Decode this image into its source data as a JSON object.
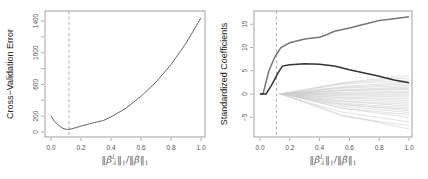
{
  "chart_data": [
    {
      "type": "line",
      "title": "",
      "xlabel": "||β̂ᴸλ||₁/||β̂||₁",
      "ylabel": "Cross−Validation Error",
      "xlim": [
        0.0,
        1.0
      ],
      "ylim": [
        0,
        1400
      ],
      "x_ticks": [
        "0.0",
        "0.2",
        "0.4",
        "0.6",
        "0.8",
        "1.0"
      ],
      "y_ticks": [
        "0",
        "200",
        "600",
        "1000",
        "1400"
      ],
      "y_minor_ticks": [
        400,
        800,
        1200
      ],
      "grid": false,
      "vline": {
        "x": 0.12,
        "style": "dashed"
      },
      "series": [
        {
          "name": "cv_error",
          "x": [
            0.0,
            0.02,
            0.05,
            0.08,
            0.11,
            0.15,
            0.2,
            0.25,
            0.3,
            0.35,
            0.4,
            0.5,
            0.6,
            0.7,
            0.8,
            0.9,
            1.0
          ],
          "y": [
            205,
            140,
            85,
            45,
            30,
            45,
            75,
            100,
            125,
            145,
            190,
            300,
            450,
            630,
            850,
            1120,
            1440
          ]
        }
      ]
    },
    {
      "type": "line",
      "title": "",
      "xlabel": "||β̂ᴸλ||₁/||β̂||₁",
      "ylabel": "Standardized Coefficients",
      "xlim": [
        0.0,
        1.0
      ],
      "ylim": [
        -8,
        17
      ],
      "x_ticks": [
        "0.0",
        "0.2",
        "0.4",
        "0.6",
        "0.8",
        "1.0"
      ],
      "y_ticks": [
        "-5",
        "0",
        "5",
        "10",
        "15"
      ],
      "grid": false,
      "vline": {
        "x": 0.11,
        "style": "dashed"
      },
      "series": [
        {
          "name": "coef_top",
          "color": "#777777",
          "x": [
            0.0,
            0.02,
            0.06,
            0.1,
            0.14,
            0.2,
            0.3,
            0.4,
            0.45,
            0.5,
            0.6,
            0.7,
            0.8,
            0.9,
            1.0
          ],
          "y": [
            0,
            0,
            5,
            8,
            10,
            11,
            11.8,
            12.2,
            12.8,
            13.5,
            14.2,
            15,
            15.8,
            16.2,
            16.6
          ]
        },
        {
          "name": "coef_second",
          "color": "#333333",
          "x": [
            0.0,
            0.04,
            0.08,
            0.12,
            0.15,
            0.2,
            0.3,
            0.4,
            0.5,
            0.6,
            0.7,
            0.8,
            0.9,
            1.0
          ],
          "y": [
            0,
            0,
            2,
            4.5,
            6,
            6.3,
            6.5,
            6.4,
            6,
            5.2,
            4.5,
            3.8,
            3,
            2.4
          ]
        },
        {
          "name": "other_coefficients",
          "color": "#cccccc",
          "count": 28,
          "start_x": 0.13,
          "end_values_at_1": [
            4,
            3.5,
            3,
            2.6,
            2.2,
            1.8,
            1.5,
            1.2,
            1,
            0.6,
            0.3,
            0,
            -0.3,
            -0.6,
            -1,
            -1.4,
            -1.8,
            -2.2,
            -2.6,
            -3,
            -3.3,
            -3.6,
            -4,
            -4.4,
            -5,
            -6,
            -6.8,
            -7.5
          ]
        }
      ]
    }
  ],
  "left_chart": {
    "ylabel": "Cross−Validation Error",
    "x_tick_labels": [
      "0.0",
      "0.2",
      "0.4",
      "0.6",
      "0.8",
      "1.0"
    ],
    "y_tick_labels": [
      "0",
      "200",
      "600",
      "1000",
      "1400"
    ]
  },
  "right_chart": {
    "ylabel": "Standardized Coefficients",
    "x_tick_labels": [
      "0.0",
      "0.2",
      "0.4",
      "0.6",
      "0.8",
      "1.0"
    ],
    "y_tick_labels": [
      "-5",
      "0",
      "5",
      "10",
      "15"
    ]
  },
  "colors": {
    "frame": "#888888",
    "cv_line": "#555555",
    "dashed": "#999999",
    "coef_top": "#777777",
    "coef_second": "#333333",
    "coef_others": "#cccccc"
  }
}
